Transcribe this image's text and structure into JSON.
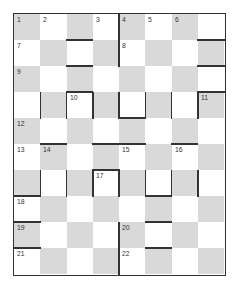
{
  "puzzle": {
    "type": "crossword-checkerboard",
    "columns": 8,
    "rows": 10,
    "colors": {
      "shade": "#d9d9d9",
      "blank": "#ffffff",
      "line": "#333333"
    },
    "numbers": [
      {
        "n": "1",
        "r": 0,
        "c": 0
      },
      {
        "n": "2",
        "r": 0,
        "c": 1
      },
      {
        "n": "3",
        "r": 0,
        "c": 3
      },
      {
        "n": "4",
        "r": 0,
        "c": 4
      },
      {
        "n": "5",
        "r": 0,
        "c": 5
      },
      {
        "n": "6",
        "r": 0,
        "c": 6
      },
      {
        "n": "7",
        "r": 1,
        "c": 0
      },
      {
        "n": "8",
        "r": 1,
        "c": 4
      },
      {
        "n": "9",
        "r": 2,
        "c": 0
      },
      {
        "n": "10",
        "r": 3,
        "c": 2
      },
      {
        "n": "11",
        "r": 3,
        "c": 7
      },
      {
        "n": "12",
        "r": 4,
        "c": 0
      },
      {
        "n": "13",
        "r": 5,
        "c": 0
      },
      {
        "n": "14",
        "r": 5,
        "c": 1
      },
      {
        "n": "15",
        "r": 5,
        "c": 4
      },
      {
        "n": "16",
        "r": 5,
        "c": 6
      },
      {
        "n": "17",
        "r": 6,
        "c": 3
      },
      {
        "n": "18",
        "r": 7,
        "c": 0
      },
      {
        "n": "19",
        "r": 8,
        "c": 0
      },
      {
        "n": "20",
        "r": 8,
        "c": 4
      },
      {
        "n": "21",
        "r": 9,
        "c": 0
      },
      {
        "n": "22",
        "r": 9,
        "c": 4
      }
    ],
    "hbars": [
      [
        1,
        2
      ],
      [
        2,
        2
      ],
      [
        1,
        7
      ],
      [
        2,
        7
      ],
      [
        3,
        2
      ],
      [
        4,
        4
      ],
      [
        3,
        7
      ],
      [
        5,
        1
      ],
      [
        5,
        3
      ],
      [
        5,
        4
      ],
      [
        5,
        6
      ],
      [
        7,
        0
      ],
      [
        6,
        3
      ],
      [
        7,
        5
      ],
      [
        8,
        0
      ],
      [
        9,
        0
      ],
      [
        8,
        5
      ],
      [
        9,
        5
      ]
    ],
    "vbars": [
      [
        4,
        0
      ],
      [
        4,
        1
      ],
      [
        1,
        3
      ],
      [
        2,
        3
      ],
      [
        3,
        3
      ],
      [
        4,
        3
      ],
      [
        5,
        3
      ],
      [
        6,
        3
      ],
      [
        7,
        3
      ],
      [
        1,
        6
      ],
      [
        2,
        6
      ],
      [
        3,
        6
      ],
      [
        4,
        6
      ],
      [
        5,
        6
      ],
      [
        6,
        6
      ],
      [
        7,
        6
      ],
      [
        4,
        8
      ],
      [
        4,
        9
      ]
    ]
  }
}
